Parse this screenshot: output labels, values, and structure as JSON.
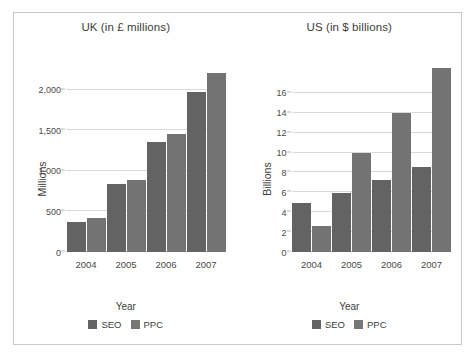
{
  "figure": {
    "border_color": "#c6c8ca",
    "background": "#ffffff"
  },
  "legend": {
    "entries": [
      {
        "label": "SEO",
        "color": "#636363"
      },
      {
        "label": "PPC",
        "color": "#767676"
      }
    ]
  },
  "chart_data": [
    {
      "type": "bar",
      "title": "UK (in £ millions)",
      "xlabel": "Year",
      "ylabel": "Millions",
      "categories": [
        "2004",
        "2005",
        "2006",
        "2007"
      ],
      "series": [
        {
          "name": "SEO",
          "color": "#636363",
          "values": [
            370,
            835,
            1360,
            1975
          ]
        },
        {
          "name": "PPC",
          "color": "#737373",
          "values": [
            420,
            890,
            1450,
            2200
          ]
        }
      ],
      "ylim": [
        0,
        2400
      ],
      "yticks": [
        0,
        500,
        1000,
        1500,
        2000
      ],
      "ytick_labels": [
        "0",
        "500",
        "1,000",
        "1,500",
        "2,000"
      ],
      "grid": true,
      "legend_position": "bottom"
    },
    {
      "type": "bar",
      "title": "US (in $ billions)",
      "xlabel": "Year",
      "ylabel": "Billions",
      "categories": [
        "2004",
        "2005",
        "2006",
        "2007"
      ],
      "series": [
        {
          "name": "SEO",
          "color": "#636363",
          "values": [
            4.9,
            5.9,
            7.2,
            8.5
          ]
        },
        {
          "name": "PPC",
          "color": "#737373",
          "values": [
            2.6,
            10.0,
            14.0,
            18.5
          ]
        }
      ],
      "ylim": [
        0,
        19.6
      ],
      "yticks": [
        0,
        2,
        4,
        6,
        8,
        10,
        12,
        14,
        16
      ],
      "ytick_labels": [
        "0",
        "2",
        "4",
        "6",
        "8",
        "10",
        "12",
        "14",
        "16"
      ],
      "grid": true,
      "legend_position": "bottom"
    }
  ]
}
